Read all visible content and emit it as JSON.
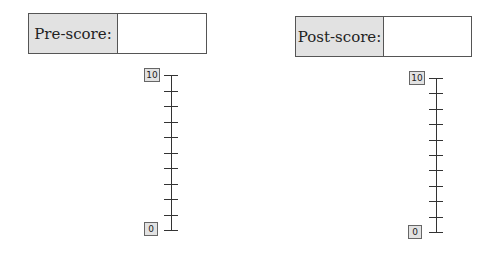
{
  "pre": {
    "label": "Pre-score:",
    "value": "",
    "scale": {
      "max_label": "10",
      "min_label": "0",
      "ticks": 11
    }
  },
  "post": {
    "label": "Post-score:",
    "value": "",
    "scale": {
      "max_label": "10",
      "min_label": "0",
      "ticks": 11
    }
  }
}
